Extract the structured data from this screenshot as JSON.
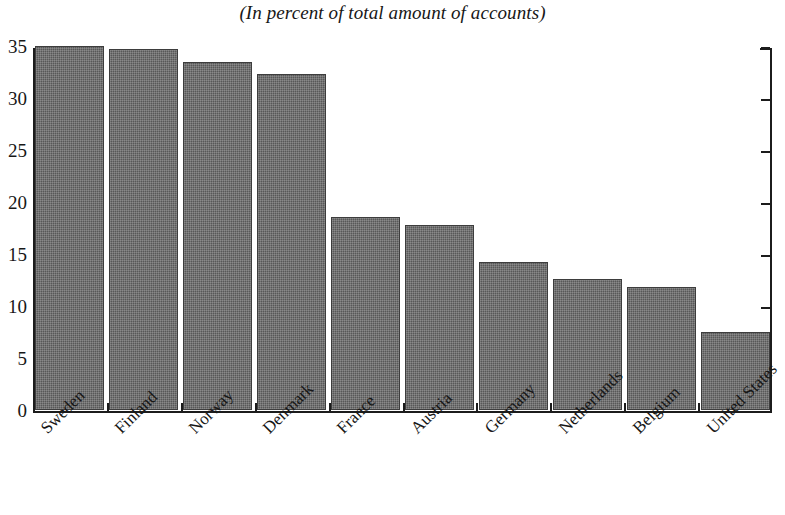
{
  "chart_data": {
    "type": "bar",
    "title": "(In percent of total amount of accounts)",
    "xlabel": "",
    "ylabel": "",
    "ylim": [
      0,
      35
    ],
    "yticks": [
      0,
      5,
      10,
      15,
      20,
      25,
      30,
      35
    ],
    "ytick_labels": [
      "0",
      "5",
      "10",
      "15",
      "20",
      "25",
      "30",
      "35"
    ],
    "grid": false,
    "legend": false,
    "bar_color": "#585858",
    "axis_color": "#1c1c1c",
    "background": "#ffffff",
    "categories": [
      "Sweden",
      "Finland",
      "Norway",
      "Denmark",
      "France",
      "Austria",
      "Germany",
      "Netherlands",
      "Belgium",
      "United States"
    ],
    "values": [
      35.0,
      34.7,
      33.5,
      32.3,
      18.6,
      17.8,
      14.2,
      12.6,
      11.8,
      7.5
    ]
  }
}
